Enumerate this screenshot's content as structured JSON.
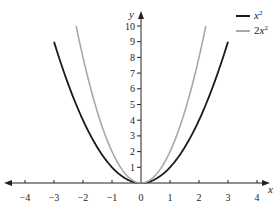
{
  "chart_data": {
    "type": "line",
    "title": "",
    "xlabel": "x",
    "ylabel": "y",
    "xlim": [
      -4.3,
      4.3
    ],
    "ylim": [
      0,
      10.6
    ],
    "x_ticks": [
      -4,
      -3,
      -2,
      -1,
      0,
      1,
      2,
      3,
      4
    ],
    "x_tick_labels": [
      "−4",
      "−3",
      "−2",
      "−1",
      "0",
      "1",
      "2",
      "3",
      "4"
    ],
    "y_ticks": [
      1,
      2,
      3,
      4,
      5,
      6,
      7,
      8,
      9,
      10
    ],
    "y_tick_labels": [
      "1",
      "2",
      "3",
      "4",
      "5",
      "6",
      "7",
      "8",
      "9",
      "10"
    ],
    "grid": false,
    "legend_position": "top-right",
    "series": [
      {
        "name": "x²",
        "formula": "y = x^2",
        "x_range": [
          -3,
          3
        ],
        "color": "#1a1a1a",
        "x": [
          -3,
          -2,
          -1,
          0,
          1,
          2,
          3
        ],
        "values": [
          9,
          4,
          1,
          0,
          1,
          4,
          9
        ]
      },
      {
        "name": "2x²",
        "formula": "y = 2x^2",
        "x_range": [
          -2.236,
          2.236
        ],
        "color": "#a8a8a8",
        "x": [
          -2.236,
          -2,
          -1,
          0,
          1,
          2,
          2.236
        ],
        "values": [
          10,
          8,
          2,
          0,
          2,
          8,
          10
        ]
      }
    ]
  },
  "legend": {
    "items": [
      {
        "base": "x",
        "sup": "2",
        "prefix": ""
      },
      {
        "base": "x",
        "sup": "2",
        "prefix": "2"
      }
    ]
  },
  "axes": {
    "x_label": "x",
    "y_label": "y"
  }
}
